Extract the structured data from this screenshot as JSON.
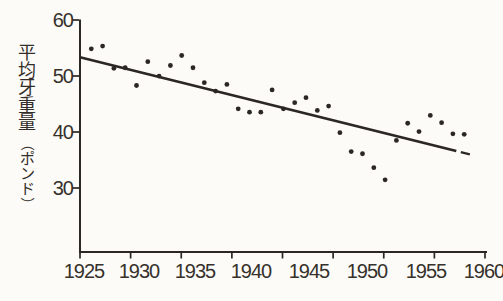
{
  "figure": {
    "background": "#fcfbf8",
    "ink_color": "#2b2724",
    "text_color": "#36312b"
  },
  "chart_data": {
    "type": "scatter",
    "title": "",
    "xlabel": "",
    "ylabel": "平均牙重量（ポンド）",
    "ylabel_chars": [
      "平",
      "均",
      "牙",
      "重",
      "量",
      "（",
      "ポ",
      "ン",
      "ド",
      "）"
    ],
    "x_ticks": [
      "1925",
      "1930",
      "1935",
      "1940",
      "1945",
      "1950",
      "1955",
      "1960"
    ],
    "y_ticks": [
      "60",
      "50",
      "40",
      "30"
    ],
    "xlim": [
      1925,
      1961
    ],
    "ylim": [
      18,
      60
    ],
    "grid": false,
    "legend": "none",
    "points": [
      [
        1926,
        54.8
      ],
      [
        1927,
        55.3
      ],
      [
        1928,
        51.3
      ],
      [
        1929,
        51.4
      ],
      [
        1930,
        48.2
      ],
      [
        1931,
        52.5
      ],
      [
        1932,
        49.9
      ],
      [
        1933,
        51.8
      ],
      [
        1934,
        53.6
      ],
      [
        1935,
        51.4
      ],
      [
        1936,
        48.7
      ],
      [
        1937,
        47.2
      ],
      [
        1938,
        48.4
      ],
      [
        1939,
        44.0
      ],
      [
        1940,
        43.4
      ],
      [
        1941,
        43.4
      ],
      [
        1942,
        47.4
      ],
      [
        1943,
        44.0
      ],
      [
        1944,
        45.1
      ],
      [
        1945,
        46.0
      ],
      [
        1946,
        43.7
      ],
      [
        1947,
        44.5
      ],
      [
        1948,
        39.7
      ],
      [
        1949,
        36.3
      ],
      [
        1950,
        35.9
      ],
      [
        1951,
        33.4
      ],
      [
        1952,
        31.2
      ],
      [
        1953,
        38.3
      ],
      [
        1954,
        41.4
      ],
      [
        1955,
        39.9
      ],
      [
        1956,
        42.8
      ],
      [
        1957,
        41.5
      ],
      [
        1958,
        39.5
      ],
      [
        1959,
        39.4
      ]
    ],
    "trend_line": {
      "solid": [
        [
          1925.0,
          53.3
        ],
        [
          1958.3,
          36.4
        ]
      ],
      "dash": [
        [
          1958.7,
          36.2
        ],
        [
          1959.5,
          35.8
        ]
      ]
    }
  }
}
